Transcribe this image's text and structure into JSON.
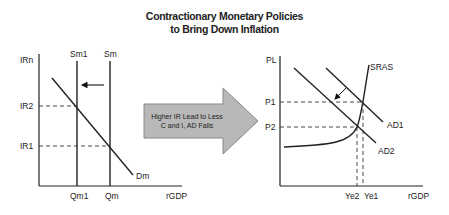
{
  "title": {
    "line1": "Contractionary Monetary Policies",
    "line2": "to Bring Down Inflation"
  },
  "left_graph": {
    "y_axis_label": "IRn",
    "x_axis_label": "rGDP",
    "supply_curves": [
      "Sm1",
      "Sm"
    ],
    "demand_curve": "Dm",
    "y_ticks": [
      "IR2",
      "IR1"
    ],
    "x_ticks": [
      "Qm1",
      "Qm"
    ],
    "shift_direction": "left"
  },
  "center_arrow": {
    "line1": "Higher IR Lead to Less",
    "line2": "C and I, AD Falls",
    "fill": "#b8b8b8"
  },
  "right_graph": {
    "y_axis_label": "PL",
    "x_axis_label": "rGDP",
    "supply_curve": "SRAS",
    "demand_curves": [
      "AD1",
      "AD2"
    ],
    "y_ticks": [
      "P1",
      "P2"
    ],
    "x_ticks": [
      "Ye2",
      "Ye1"
    ],
    "shift_direction": "down-left"
  }
}
